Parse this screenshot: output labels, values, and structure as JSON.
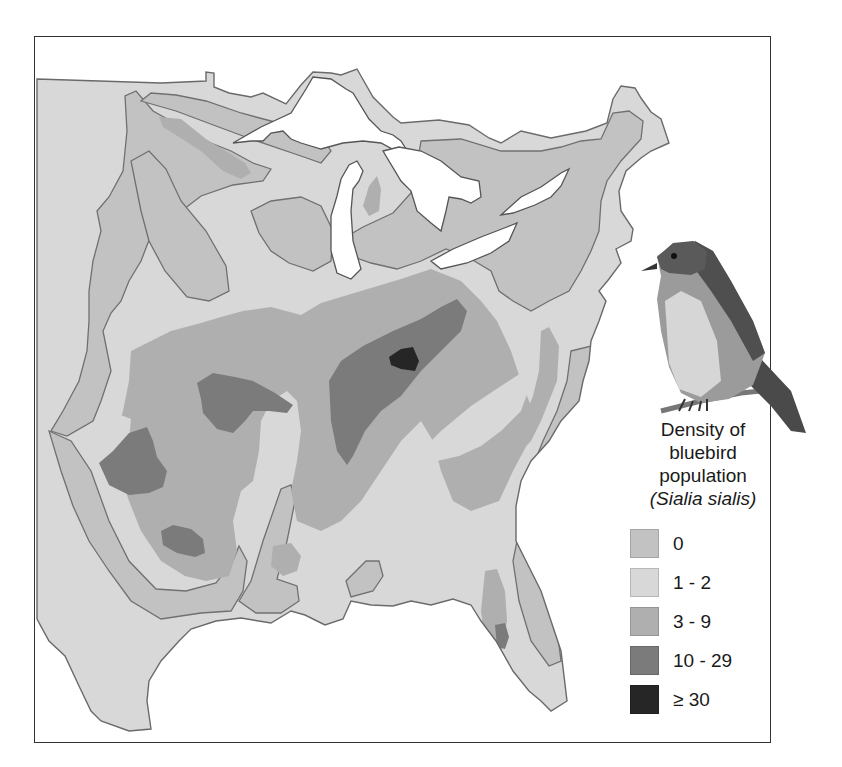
{
  "figure": {
    "title_line1": "Density of",
    "title_line2": "bluebird",
    "title_line3": "population",
    "scientific_name": "(Sialia sialis)"
  },
  "legend": {
    "items": [
      {
        "label": "0",
        "color": "#c2c2c2"
      },
      {
        "label": "1 - 2",
        "color": "#d8d8d8"
      },
      {
        "label": "3 - 9",
        "color": "#afafaf"
      },
      {
        "label": "10 - 29",
        "color": "#7b7b7b"
      },
      {
        "label": "≥ 30",
        "color": "#262626"
      }
    ]
  },
  "colors": {
    "water": "#ffffff",
    "outline": "#6a6a6a",
    "frame": "#333333"
  },
  "map": {
    "region": "Eastern United States",
    "illustration": "Eastern bluebird perched on branch"
  }
}
